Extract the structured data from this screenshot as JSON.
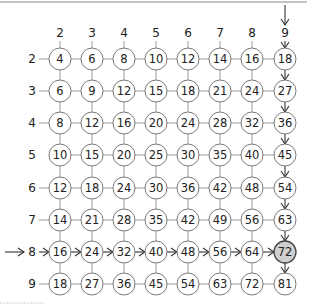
{
  "diagram": {
    "column_labels": [
      "2",
      "3",
      "4",
      "5",
      "6",
      "7",
      "8",
      "9"
    ],
    "row_labels": [
      "2",
      "3",
      "4",
      "5",
      "6",
      "7",
      "8",
      "9"
    ],
    "cells": [
      [
        "4",
        "6",
        "8",
        "10",
        "12",
        "14",
        "16",
        "18"
      ],
      [
        "6",
        "9",
        "12",
        "15",
        "18",
        "21",
        "24",
        "27"
      ],
      [
        "8",
        "12",
        "16",
        "20",
        "24",
        "28",
        "32",
        "36"
      ],
      [
        "10",
        "15",
        "20",
        "25",
        "30",
        "35",
        "40",
        "45"
      ],
      [
        "12",
        "18",
        "24",
        "30",
        "36",
        "42",
        "48",
        "54"
      ],
      [
        "14",
        "21",
        "28",
        "35",
        "42",
        "49",
        "56",
        "63"
      ],
      [
        "16",
        "24",
        "32",
        "40",
        "48",
        "56",
        "64",
        "72"
      ],
      [
        "18",
        "27",
        "36",
        "45",
        "54",
        "63",
        "72",
        "81"
      ]
    ],
    "highlighted_row": "8",
    "highlighted_column": "9",
    "highlighted_cell": "72",
    "colors": {
      "highlight_fill": "#cfcfcf",
      "line": "#9a9a9a",
      "arrow": "#333333"
    }
  }
}
